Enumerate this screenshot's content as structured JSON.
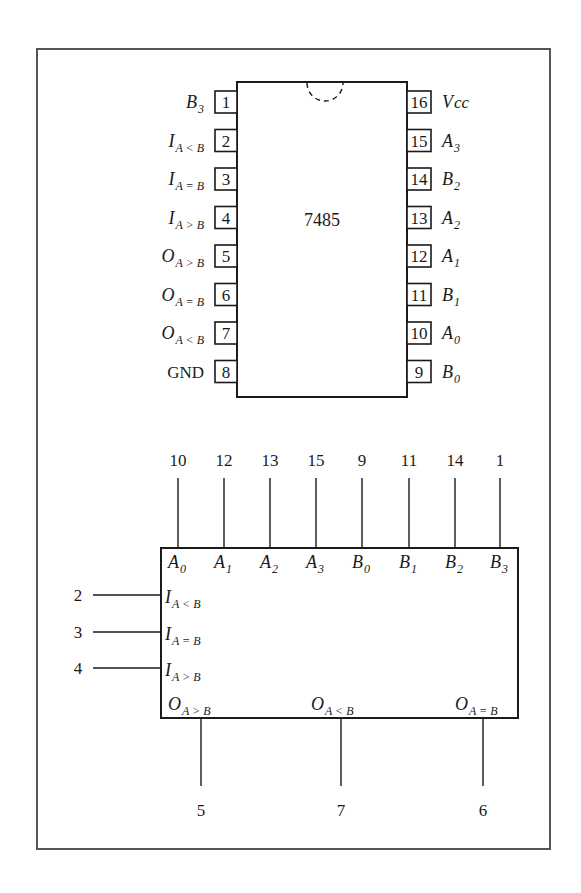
{
  "figure": {
    "chip_name": "7485",
    "frame_color": "#555555",
    "ink_color": "#1a1a1a"
  },
  "dip_package": {
    "left_pins": [
      {
        "pin": "1",
        "main": "B",
        "sub": "3",
        "italic": true
      },
      {
        "pin": "2",
        "main": "I",
        "sub": "A < B",
        "italic": true
      },
      {
        "pin": "3",
        "main": "I",
        "sub": "A = B",
        "italic": true
      },
      {
        "pin": "4",
        "main": "I",
        "sub": "A > B",
        "italic": true
      },
      {
        "pin": "5",
        "main": "O",
        "sub": "A > B",
        "italic": true
      },
      {
        "pin": "6",
        "main": "O",
        "sub": "A = B",
        "italic": true
      },
      {
        "pin": "7",
        "main": "O",
        "sub": "A < B",
        "italic": true
      },
      {
        "pin": "8",
        "main": "GND",
        "sub": "",
        "italic": false
      }
    ],
    "right_pins": [
      {
        "pin": "16",
        "main": "V",
        "sub": "cc"
      },
      {
        "pin": "15",
        "main": "A",
        "sub": "3"
      },
      {
        "pin": "14",
        "main": "B",
        "sub": "2"
      },
      {
        "pin": "13",
        "main": "A",
        "sub": "2"
      },
      {
        "pin": "12",
        "main": "A",
        "sub": "1"
      },
      {
        "pin": "11",
        "main": "B",
        "sub": "1"
      },
      {
        "pin": "10",
        "main": "A",
        "sub": "0"
      },
      {
        "pin": "9",
        "main": "B",
        "sub": "0"
      }
    ]
  },
  "logic_symbol": {
    "top_inputs": [
      {
        "pin": "10",
        "main": "A",
        "sub": "0"
      },
      {
        "pin": "12",
        "main": "A",
        "sub": "1"
      },
      {
        "pin": "13",
        "main": "A",
        "sub": "2"
      },
      {
        "pin": "15",
        "main": "A",
        "sub": "3"
      },
      {
        "pin": "9",
        "main": "B",
        "sub": "0"
      },
      {
        "pin": "11",
        "main": "B",
        "sub": "1"
      },
      {
        "pin": "14",
        "main": "B",
        "sub": "2"
      },
      {
        "pin": "1",
        "main": "B",
        "sub": "3"
      }
    ],
    "left_inputs": [
      {
        "pin": "2",
        "main": "I",
        "sub": "A < B"
      },
      {
        "pin": "3",
        "main": "I",
        "sub": "A = B"
      },
      {
        "pin": "4",
        "main": "I",
        "sub": "A > B"
      }
    ],
    "bottom_outputs": [
      {
        "pin": "5",
        "main": "O",
        "sub": "A > B"
      },
      {
        "pin": "7",
        "main": "O",
        "sub": "A < B"
      },
      {
        "pin": "6",
        "main": "O",
        "sub": "A = B"
      }
    ]
  }
}
